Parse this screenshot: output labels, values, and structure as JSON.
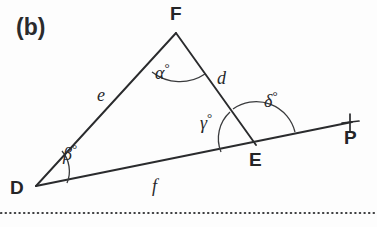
{
  "figure": {
    "panel_label": "(b)",
    "background_color": "#fdfdfd",
    "stroke_color": "#2a2b2d",
    "type": "geometry-diagram"
  },
  "vertices": [
    {
      "name": "D",
      "label": "D",
      "x": 36,
      "y": 186
    },
    {
      "name": "F",
      "label": "F",
      "x": 176,
      "y": 33
    },
    {
      "name": "E",
      "label": "E",
      "x": 256,
      "y": 145
    },
    {
      "name": "P",
      "label": "P",
      "x": 350,
      "y": 123
    }
  ],
  "sides": [
    {
      "name": "e",
      "label": "e",
      "between": "D-F",
      "label_x": 103,
      "label_y": 95
    },
    {
      "name": "d",
      "label": "d",
      "between": "F-E",
      "label_x": 222,
      "label_y": 78
    },
    {
      "name": "f",
      "label": "f",
      "between": "D-E",
      "label_x": 156,
      "label_y": 186
    }
  ],
  "angles": [
    {
      "name": "alpha",
      "symbol": "α",
      "degree": "°",
      "at_vertex": "F",
      "kind": "interior",
      "label_x": 160,
      "label_y": 72
    },
    {
      "name": "beta",
      "symbol": "β",
      "degree": "°",
      "at_vertex": "D",
      "kind": "interior",
      "label_x": 68,
      "label_y": 153
    },
    {
      "name": "gamma",
      "symbol": "γ",
      "degree": "°",
      "at_vertex": "E",
      "kind": "interior",
      "label_x": 205,
      "label_y": 122
    },
    {
      "name": "delta",
      "symbol": "δ",
      "degree": "°",
      "at_vertex": "E",
      "kind": "exterior",
      "label_x": 268,
      "label_y": 100
    }
  ],
  "marks": [
    {
      "name": "p-tick",
      "kind": "tick-cross",
      "x": 350,
      "y": 123
    }
  ],
  "separator": {
    "name": "dotted-rule",
    "style": "dotted",
    "y": 213
  }
}
